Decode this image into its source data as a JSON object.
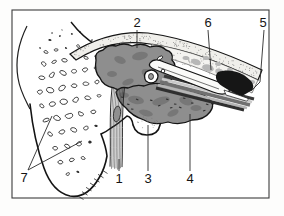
{
  "figure": {
    "kind": "anatomical-line-drawing-plate",
    "labels": [
      {
        "id": "label-1",
        "text": "1"
      },
      {
        "id": "label-2",
        "text": "2"
      },
      {
        "id": "label-3",
        "text": "3"
      },
      {
        "id": "label-4",
        "text": "4"
      },
      {
        "id": "label-5",
        "text": "5"
      },
      {
        "id": "label-6",
        "text": "6"
      },
      {
        "id": "label-7",
        "text": "7"
      }
    ]
  },
  "colors": {
    "ink": "#141414",
    "frame": "#3c3c3c",
    "tissue_gray": "#8e8e8e",
    "marrow_gray": "#b7b7b7",
    "band_fill": "#f0efeb",
    "wedge_black": "#161616",
    "paper": "#ffffff"
  }
}
